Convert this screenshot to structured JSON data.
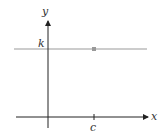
{
  "diagram": {
    "axes": {
      "x_label": "x",
      "y_label": "y"
    },
    "labels": {
      "k": "k",
      "c": "c"
    },
    "colors": {
      "axis": "#222222",
      "line": "#999999",
      "point": "#999999"
    }
  }
}
